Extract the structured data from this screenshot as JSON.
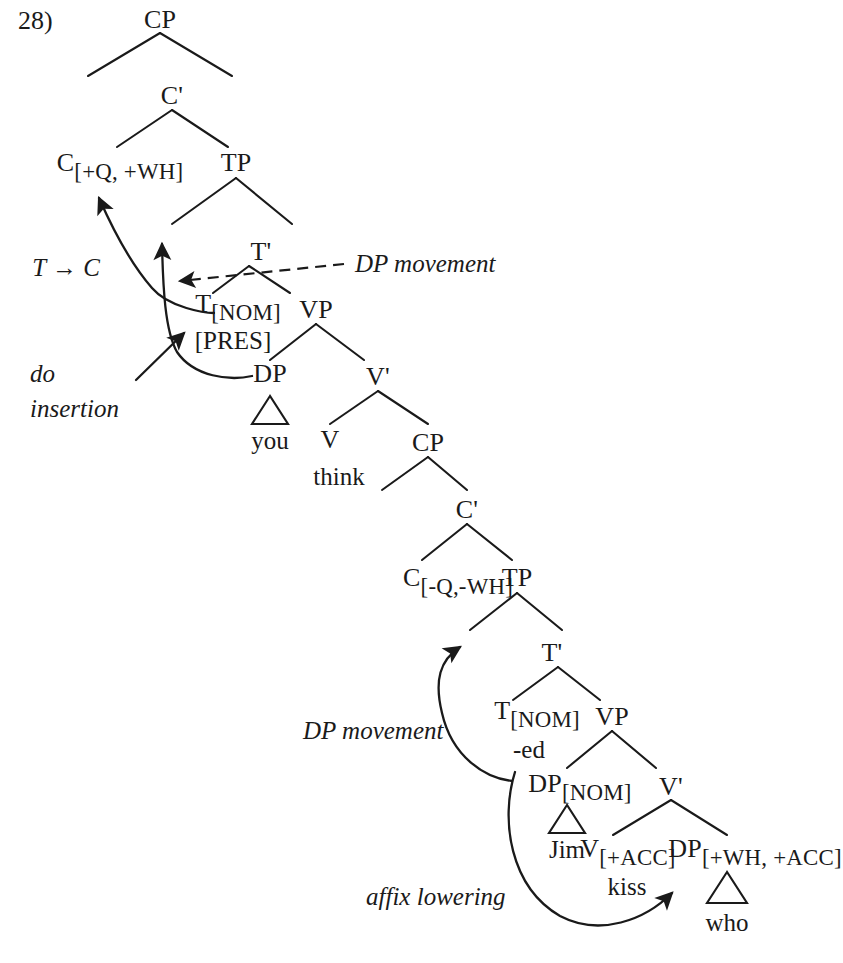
{
  "figure": {
    "example_number": "28)",
    "domain": "syntax-tree-diagram",
    "ink_color": "#1a1a1a",
    "background_color": "#ffffff"
  },
  "matrix_clause": {
    "cp": "CP",
    "c_bar": "C'",
    "c_head": {
      "label": "C",
      "features": "[+Q, +WH]"
    },
    "tp": "TP",
    "t_bar": "T'",
    "t_head": {
      "label": "T",
      "features": "[NOM]",
      "tense": "[PRES]"
    },
    "vp": "VP",
    "subject_dp": {
      "label": "DP",
      "triangle_text": "you"
    },
    "v_bar": "V'",
    "v_head": {
      "label": "V",
      "word": "think"
    },
    "embedded_cp": "CP"
  },
  "embedded_clause": {
    "c_bar": "C'",
    "c_head": {
      "label": "C",
      "features": "[-Q,-WH]"
    },
    "tp": "TP",
    "t_bar": "T'",
    "t_head": {
      "label": "T",
      "features": "[NOM]",
      "affix": "-ed"
    },
    "vp": "VP",
    "subject_dp": {
      "label": "DP",
      "features": "[NOM]",
      "triangle_text": "Jim"
    },
    "v_bar": "V'",
    "v_head": {
      "label": "V",
      "features": "[+ACC]",
      "word": "kiss"
    },
    "object_dp": {
      "label": "DP",
      "features": "[+WH, +ACC]",
      "triangle_text": "who"
    }
  },
  "annotations": {
    "t_to_c": "T → C",
    "do_insertion_line1": "do",
    "do_insertion_line2": "insertion",
    "dp_movement_matrix": "DP movement",
    "dp_movement_embedded": "DP movement",
    "affix_lowering": "affix lowering"
  }
}
